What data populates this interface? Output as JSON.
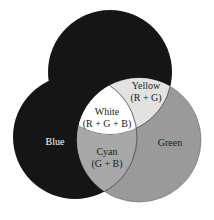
{
  "diagram": {
    "type": "venn",
    "colors": {
      "red_circle": "#151515",
      "blue_circle": "#151515",
      "green_circle": "#9a9a9a",
      "white_region": "#ffffff",
      "yellow_region": "#e2e2e2",
      "cyan_region": "#a8a8a8",
      "background": "#ffffff",
      "outline": "#555555"
    },
    "regions": {
      "blue": {
        "label": "Blue"
      },
      "green": {
        "label": "Green"
      },
      "white": {
        "label": "White",
        "formula": "(R + G + B)"
      },
      "yellow": {
        "label": "Yellow",
        "formula": "(R + G)"
      },
      "cyan": {
        "label": "Cyan",
        "formula": "(G + B)"
      }
    }
  }
}
